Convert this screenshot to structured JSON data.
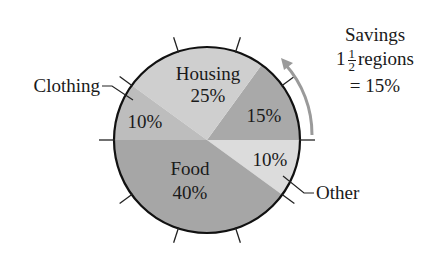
{
  "chart_data": {
    "type": "pie",
    "title": "",
    "slices": [
      {
        "label": "Other",
        "value": 10,
        "display": "10%",
        "color": "#dcdcdc",
        "start_deg": -36,
        "end_deg": 0
      },
      {
        "label": "Savings",
        "value": 15,
        "display": "15%",
        "color": "#a9a9a9",
        "start_deg": 0,
        "end_deg": 54
      },
      {
        "label": "Housing",
        "value": 25,
        "display": "25%",
        "color": "#cfcfcf",
        "start_deg": 54,
        "end_deg": 144
      },
      {
        "label": "Clothing",
        "value": 10,
        "display": "10%",
        "color": "#bdbdbd",
        "start_deg": 144,
        "end_deg": 180
      },
      {
        "label": "Food",
        "value": 40,
        "display": "40%",
        "color": "#a6a6a6",
        "start_deg": 180,
        "end_deg": 324
      }
    ],
    "tick_marks": 10,
    "annotation": {
      "line1": "Savings",
      "whole": "1",
      "num": "1",
      "den": "2",
      "word": "regions",
      "line3": "= 15%"
    }
  },
  "labels": {
    "housing_name": "Housing",
    "housing_pct": "25%",
    "savings_pct": "15%",
    "clothing_name": "Clothing",
    "clothing_pct": "10%",
    "food_name": "Food",
    "food_pct": "40%",
    "other_name": "Other",
    "other_pct": "10%"
  }
}
